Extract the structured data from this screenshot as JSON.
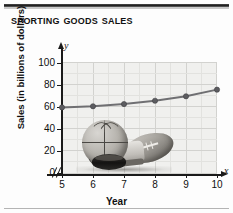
{
  "figure": {
    "title": "Sporting Goods Sales"
  },
  "chart_data": {
    "type": "line",
    "title": "Sporting Goods Sales",
    "xlabel": "Year",
    "ylabel": "Sales (in billions of dollars)",
    "x": [
      5,
      6,
      7,
      8,
      9,
      10
    ],
    "values": [
      60,
      61,
      63,
      66,
      70,
      76
    ],
    "series": [
      {
        "name": "Sales",
        "values": [
          60,
          61,
          63,
          66,
          70,
          76
        ]
      }
    ],
    "xtick_labels": [
      "5",
      "6",
      "7",
      "8",
      "9",
      "10"
    ],
    "ytick_labels": [
      "0",
      "20",
      "40",
      "60",
      "80",
      "100"
    ],
    "xlim": [
      5,
      10
    ],
    "ylim": [
      0,
      100
    ],
    "grid": true,
    "legend": "none",
    "x_axis_letter": "x",
    "y_axis_letter": "y",
    "x_axis_break": true,
    "line_color": "#6f6f72",
    "marker_color": "#5c5c60",
    "plot_background": "#f0f0ee",
    "gridline_color": "#d2d2cf"
  },
  "image": {
    "alt": "sporting-goods-photo",
    "items": [
      "basketball",
      "football",
      "hockey-puck",
      "athletic-shoe"
    ]
  }
}
